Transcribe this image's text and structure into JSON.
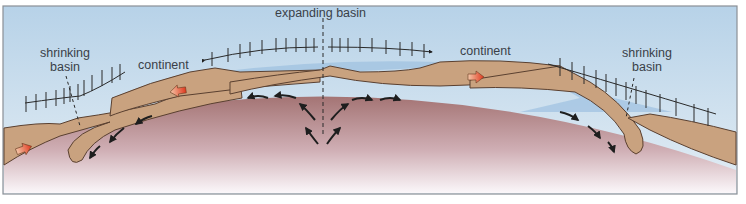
{
  "figure": {
    "labels": {
      "expanding_basin": "expanding basin",
      "shrinking_basin_left_line1": "shrinking",
      "shrinking_basin_left_line2": "basin",
      "shrinking_basin_right_line1": "shrinking",
      "shrinking_basin_right_line2": "basin",
      "continent_left": "continent",
      "continent_right": "continent"
    },
    "colors": {
      "sky_top": "#b9d3e8",
      "sky_bottom": "#dbe8f1",
      "ocean": "#a9c8e3",
      "crust": "#c9a27f",
      "crust_edge": "#5a4030",
      "mantle_top": "#a57878",
      "mantle_bottom": "#fbf6f8",
      "arrow_red": "#e04a2a",
      "frame": "#8a8f96"
    }
  }
}
